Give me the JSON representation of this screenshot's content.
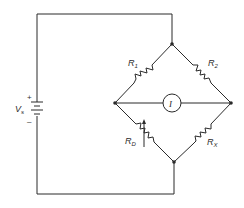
{
  "diagram": {
    "source": {
      "label": "V",
      "subscript": "s",
      "plus": "+",
      "minus": "–"
    },
    "resistors": [
      {
        "id": "R1",
        "label": "R",
        "subscript": "1",
        "variable": false
      },
      {
        "id": "R2",
        "label": "R",
        "subscript": "2",
        "variable": false
      },
      {
        "id": "RD",
        "label": "R",
        "subscript": "D",
        "variable": true
      },
      {
        "id": "RX",
        "label": "R",
        "subscript": "X",
        "variable": false
      }
    ],
    "meter": {
      "label": "I"
    },
    "nodes": [
      "top",
      "left",
      "right",
      "bottom"
    ],
    "colors": {
      "ink": "#2a2a2a",
      "background": "#ffffff"
    }
  }
}
